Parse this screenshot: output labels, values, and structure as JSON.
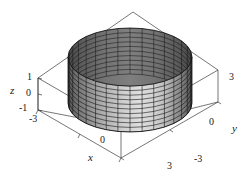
{
  "figure": {
    "title": "",
    "background_color": "#ffffff",
    "line_color": "#3b3b3b",
    "mesh_color": "#1c1c1c",
    "surface_light": "#e8e8e8",
    "surface_dark": "#6b6b6b",
    "interior_color": "#fbfbfb"
  },
  "axes": {
    "x": {
      "label": "x",
      "label_pos": {
        "left": 88,
        "top": 155
      },
      "ticks": [
        {
          "value": "-3",
          "left": 32,
          "top": 113
        },
        {
          "value": "0",
          "left": 101,
          "top": 136
        },
        {
          "value": "3",
          "left": 168,
          "top": 160
        }
      ]
    },
    "y": {
      "label": "y",
      "label_pos": {
        "left": 231,
        "top": 123
      },
      "ticks": [
        {
          "value": "-3",
          "left": 195,
          "top": 155
        },
        {
          "value": "0",
          "left": 208,
          "top": 118
        },
        {
          "value": "3",
          "left": 228,
          "top": 74
        }
      ]
    },
    "z": {
      "label": "z",
      "label_pos": {
        "left": 10,
        "top": 85
      },
      "ticks": [
        {
          "value": "1",
          "left": 27,
          "top": 72
        },
        {
          "value": "0",
          "left": 25,
          "top": 88
        },
        {
          "value": "-1",
          "left": 20,
          "top": 104
        }
      ]
    }
  },
  "chart_data": {
    "type": "surface",
    "title": "",
    "xlabel": "x",
    "ylabel": "y",
    "zlabel": "z",
    "xlim": [
      -3,
      3
    ],
    "ylim": [
      -3,
      3
    ],
    "zlim": [
      -1,
      1
    ],
    "xticks": [
      -3,
      0,
      3
    ],
    "yticks": [
      -3,
      0,
      3
    ],
    "zticks": [
      -1,
      0,
      1
    ],
    "grid": false,
    "legend": false,
    "surface": {
      "name": "circular cylinder x^2 + y^2 = r^2",
      "description": "Mesh-shaded vertical cylinder of radius 2 spanning z from -1 to 1, open at top and bottom, drawn inside a wireframe bounding box.",
      "radius": 2,
      "z_min": -1,
      "z_max": 1,
      "mesh_u_divisions": 32,
      "mesh_v_divisions": 10,
      "shading": "grayscale, dark on the left/back, light toward the right front"
    },
    "projection": {
      "type": "axonometric",
      "cylinder_center_px": {
        "x": 130,
        "y": 80
      },
      "top_ellipse": {
        "cx": 130,
        "cy": 57,
        "rx": 62,
        "ry": 29
      },
      "bottom_ellipse": {
        "cx": 130,
        "cy": 103,
        "rx": 62,
        "ry": 29
      }
    },
    "box_corners_px": {
      "left_top": {
        "x": 38,
        "y": 78
      },
      "left_bottom": {
        "x": 38,
        "y": 110
      },
      "back_top": {
        "x": 133,
        "y": 12
      },
      "right_top": {
        "x": 218,
        "y": 70
      },
      "right_bottom": {
        "x": 218,
        "y": 102
      },
      "front_bottom": {
        "x": 186,
        "y": 158
      },
      "front_bottom_top": {
        "x": 186,
        "y": 126
      },
      "left_front_bottom": {
        "x": 40,
        "y": 115
      }
    }
  }
}
